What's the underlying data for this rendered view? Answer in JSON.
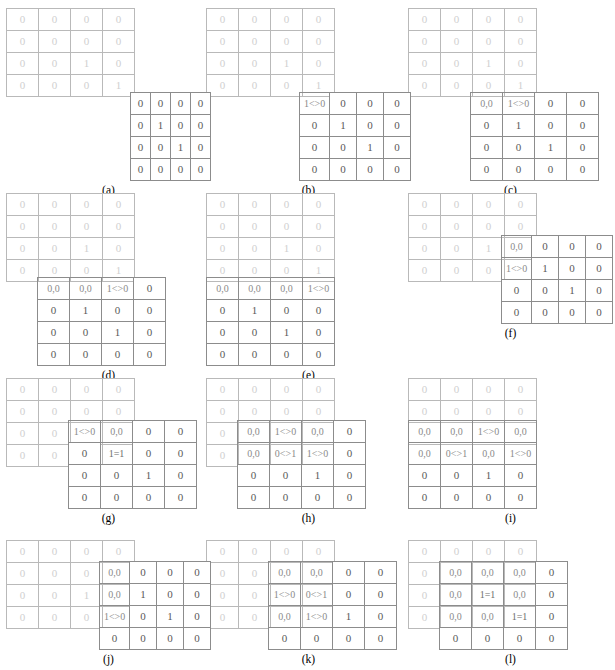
{
  "figure": {
    "type": "matrix-alignment-sliding-window",
    "panel_count": 12,
    "grid_rows": 4,
    "grid_cols": 4,
    "colors": {
      "faint_matrix_text": "#cfcfcf",
      "faint_matrix_border": "#b9b9b9",
      "solid_matrix_text": "#595959",
      "solid_matrix_border": "#8c8c8c",
      "overlap_text": "#8a8a8a",
      "background": "#ffffff"
    },
    "faint_matrix": [
      [
        "0",
        "0",
        "0",
        "0"
      ],
      [
        "0",
        "0",
        "0",
        "0"
      ],
      [
        "0",
        "0",
        "1",
        "0"
      ],
      [
        "0",
        "0",
        "0",
        "1"
      ]
    ],
    "solid_matrix": [
      [
        "0",
        "0",
        "0",
        "0"
      ],
      [
        "0",
        "1",
        "0",
        "0"
      ],
      [
        "0",
        "0",
        "1",
        "0"
      ],
      [
        "0",
        "0",
        "0",
        "0"
      ]
    ],
    "notation": {
      "pair": "0,0",
      "not_equal": "<>",
      "equal": "=",
      "mismatch_1_0": "1<>0",
      "mismatch_0_1": "0<>1",
      "match_1_1": "1=1"
    }
  },
  "panels": [
    {
      "id": "a",
      "caption": "(a)",
      "offset_cols": 4,
      "offset_rows": 2,
      "overlap": []
    },
    {
      "id": "b",
      "caption": "(b)",
      "offset_cols": 3,
      "offset_rows": 2,
      "overlap": [
        {
          "row": 0,
          "col": 0,
          "text": "1<>0",
          "kind": "mismatch"
        }
      ]
    },
    {
      "id": "c",
      "caption": "(c)",
      "offset_cols": 2,
      "offset_rows": 2,
      "overlap": [
        {
          "row": 0,
          "col": 0,
          "text": "0,0",
          "kind": "pair"
        },
        {
          "row": 0,
          "col": 1,
          "text": "1<>0",
          "kind": "mismatch"
        }
      ]
    },
    {
      "id": "d",
      "caption": "(d)",
      "offset_cols": 1,
      "offset_rows": 2,
      "overlap": [
        {
          "row": 0,
          "col": 0,
          "text": "0,0",
          "kind": "pair"
        },
        {
          "row": 0,
          "col": 1,
          "text": "0,0",
          "kind": "pair"
        },
        {
          "row": 0,
          "col": 2,
          "text": "1<>0",
          "kind": "mismatch"
        }
      ]
    },
    {
      "id": "e",
      "caption": "(e)",
      "offset_cols": 0,
      "offset_rows": 2,
      "overlap": [
        {
          "row": 0,
          "col": 0,
          "text": "0,0",
          "kind": "pair"
        },
        {
          "row": 0,
          "col": 1,
          "text": "0,0",
          "kind": "pair"
        },
        {
          "row": 0,
          "col": 2,
          "text": "0,0",
          "kind": "pair"
        },
        {
          "row": 0,
          "col": 3,
          "text": "1<>0",
          "kind": "mismatch"
        }
      ]
    },
    {
      "id": "f",
      "caption": "(f)",
      "offset_cols": 3,
      "offset_rows": 1,
      "overlap": [
        {
          "row": 0,
          "col": 0,
          "text": "0,0",
          "kind": "pair"
        },
        {
          "row": 1,
          "col": 0,
          "text": "1<>0",
          "kind": "mismatch"
        }
      ]
    },
    {
      "id": "g",
      "caption": "(g)",
      "offset_cols": 2,
      "offset_rows": 1,
      "overlap": [
        {
          "row": 0,
          "col": 0,
          "text": "1<>0",
          "kind": "mismatch"
        },
        {
          "row": 0,
          "col": 1,
          "text": "0,0",
          "kind": "pair"
        },
        {
          "row": 1,
          "col": 1,
          "text": "1=1",
          "kind": "match"
        }
      ]
    },
    {
      "id": "h",
      "caption": "(h)",
      "offset_cols": 1,
      "offset_rows": 1,
      "overlap": [
        {
          "row": 0,
          "col": 0,
          "text": "0,0",
          "kind": "pair"
        },
        {
          "row": 0,
          "col": 1,
          "text": "1<>0",
          "kind": "mismatch"
        },
        {
          "row": 0,
          "col": 2,
          "text": "0,0",
          "kind": "pair"
        },
        {
          "row": 1,
          "col": 0,
          "text": "0,0",
          "kind": "pair"
        },
        {
          "row": 1,
          "col": 1,
          "text": "0<>1",
          "kind": "mismatch"
        },
        {
          "row": 1,
          "col": 2,
          "text": "1<>0",
          "kind": "mismatch"
        }
      ]
    },
    {
      "id": "i",
      "caption": "(i)",
      "offset_cols": 0,
      "offset_rows": 1,
      "overlap": [
        {
          "row": 0,
          "col": 0,
          "text": "0,0",
          "kind": "pair"
        },
        {
          "row": 0,
          "col": 1,
          "text": "0,0",
          "kind": "pair"
        },
        {
          "row": 0,
          "col": 2,
          "text": "1<>0",
          "kind": "mismatch"
        },
        {
          "row": 0,
          "col": 3,
          "text": "0,0",
          "kind": "pair"
        },
        {
          "row": 1,
          "col": 0,
          "text": "0,0",
          "kind": "pair"
        },
        {
          "row": 1,
          "col": 1,
          "text": "0<>1",
          "kind": "mismatch"
        },
        {
          "row": 1,
          "col": 2,
          "text": "0,0",
          "kind": "pair"
        },
        {
          "row": 1,
          "col": 3,
          "text": "1<>0",
          "kind": "mismatch"
        }
      ]
    },
    {
      "id": "j",
      "caption": "(j)",
      "offset_cols": 3,
      "offset_rows": 0,
      "overlap": [
        {
          "row": 0,
          "col": 0,
          "text": "0,0",
          "kind": "pair"
        },
        {
          "row": 1,
          "col": 0,
          "text": "0,0",
          "kind": "pair"
        },
        {
          "row": 2,
          "col": 0,
          "text": "1<>0",
          "kind": "mismatch"
        }
      ]
    },
    {
      "id": "k",
      "caption": "(k)",
      "offset_cols": 2,
      "offset_rows": 0,
      "overlap": [
        {
          "row": 0,
          "col": 0,
          "text": "0,0",
          "kind": "pair"
        },
        {
          "row": 0,
          "col": 1,
          "text": "0,0",
          "kind": "pair"
        },
        {
          "row": 1,
          "col": 0,
          "text": "1<>0",
          "kind": "mismatch"
        },
        {
          "row": 1,
          "col": 1,
          "text": "0<>1",
          "kind": "mismatch"
        },
        {
          "row": 2,
          "col": 0,
          "text": "0,0",
          "kind": "pair"
        },
        {
          "row": 2,
          "col": 1,
          "text": "1<>0",
          "kind": "mismatch"
        }
      ]
    },
    {
      "id": "l",
      "caption": "(l)",
      "offset_cols": 1,
      "offset_rows": 0,
      "overlap": [
        {
          "row": 0,
          "col": 0,
          "text": "0,0",
          "kind": "pair"
        },
        {
          "row": 0,
          "col": 1,
          "text": "0,0",
          "kind": "pair"
        },
        {
          "row": 0,
          "col": 2,
          "text": "0,0",
          "kind": "pair"
        },
        {
          "row": 1,
          "col": 0,
          "text": "0,0",
          "kind": "pair"
        },
        {
          "row": 1,
          "col": 1,
          "text": "1=1",
          "kind": "match"
        },
        {
          "row": 1,
          "col": 2,
          "text": "0,0",
          "kind": "pair"
        },
        {
          "row": 2,
          "col": 0,
          "text": "0,0",
          "kind": "pair"
        },
        {
          "row": 2,
          "col": 1,
          "text": "0,0",
          "kind": "pair"
        },
        {
          "row": 2,
          "col": 2,
          "text": "1=1",
          "kind": "match"
        }
      ]
    }
  ]
}
